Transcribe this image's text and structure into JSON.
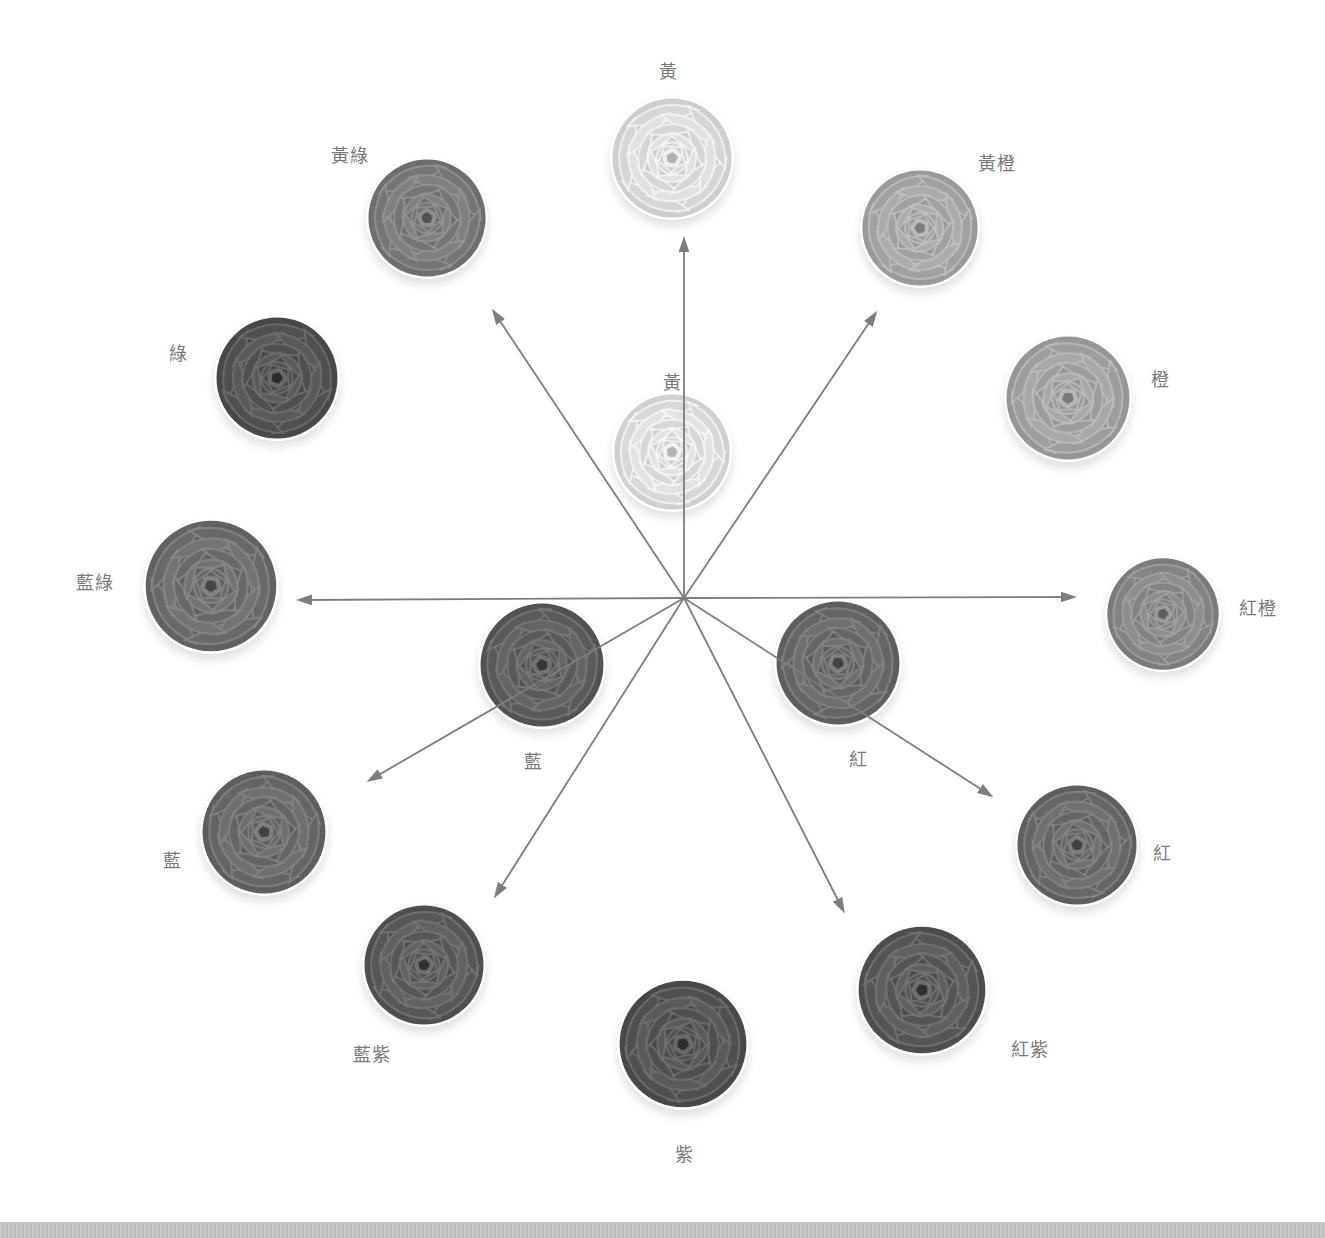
{
  "diagram": {
    "type": "color-wheel-mixing",
    "center": {
      "x": 684,
      "y": 598
    },
    "arrow_color": "#7d7d7d",
    "arrows": [
      {
        "to": "黃 (outer)",
        "x2": 684,
        "y2": 240
      },
      {
        "to": "黃綠",
        "x2": 494,
        "y2": 312
      },
      {
        "to": "黃橙",
        "x2": 875,
        "y2": 314
      },
      {
        "to": "藍綠",
        "x2": 300,
        "y2": 600
      },
      {
        "to": "紅橙",
        "x2": 1073,
        "y2": 597
      },
      {
        "to": "藍 (outer)",
        "x2": 370,
        "y2": 780
      },
      {
        "to": "藍紫",
        "x2": 496,
        "y2": 895
      },
      {
        "to": "紅紫",
        "x2": 843,
        "y2": 910
      },
      {
        "to": "紅 (outer)",
        "x2": 990,
        "y2": 795
      }
    ]
  },
  "inner_roses": [
    {
      "id": "yellow-inner",
      "label": "黃",
      "cx": 672,
      "cy": 452,
      "r": 60,
      "shade": "#dcdcdc",
      "label_x": 672,
      "label_y": 381
    },
    {
      "id": "blue-inner",
      "label": "藍",
      "cx": 542,
      "cy": 665,
      "r": 64,
      "shade": "#5e5e5e",
      "label_x": 533,
      "label_y": 760
    },
    {
      "id": "red-inner",
      "label": "紅",
      "cx": 838,
      "cy": 663,
      "r": 64,
      "shade": "#6a6a6a",
      "label_x": 858,
      "label_y": 758
    }
  ],
  "outer_roses": [
    {
      "id": "yellow",
      "label": "黃",
      "cx": 672,
      "cy": 158,
      "r": 62,
      "shade": "#dadada",
      "label_x": 668,
      "label_y": 70
    },
    {
      "id": "yellow-orange",
      "label": "黃橙",
      "cx": 920,
      "cy": 228,
      "r": 60,
      "shade": "#a6a6a6",
      "label_x": 997,
      "label_y": 162
    },
    {
      "id": "orange",
      "label": "橙",
      "cx": 1068,
      "cy": 398,
      "r": 64,
      "shade": "#a2a2a2",
      "label_x": 1160,
      "label_y": 378
    },
    {
      "id": "red-orange",
      "label": "紅橙",
      "cx": 1163,
      "cy": 614,
      "r": 58,
      "shade": "#878787",
      "label_x": 1258,
      "label_y": 607
    },
    {
      "id": "red",
      "label": "紅",
      "cx": 1077,
      "cy": 845,
      "r": 62,
      "shade": "#6b6b6b",
      "label_x": 1162,
      "label_y": 852
    },
    {
      "id": "red-violet",
      "label": "紅紫",
      "cx": 922,
      "cy": 990,
      "r": 66,
      "shade": "#595959",
      "label_x": 1030,
      "label_y": 1048
    },
    {
      "id": "violet",
      "label": "紫",
      "cx": 683,
      "cy": 1044,
      "r": 66,
      "shade": "#545454",
      "label_x": 684,
      "label_y": 1153
    },
    {
      "id": "blue-violet",
      "label": "藍紫",
      "cx": 424,
      "cy": 965,
      "r": 62,
      "shade": "#5b5b5b",
      "label_x": 372,
      "label_y": 1053
    },
    {
      "id": "blue",
      "label": "藍",
      "cx": 264,
      "cy": 832,
      "r": 64,
      "shade": "#6a6a6a",
      "label_x": 172,
      "label_y": 859
    },
    {
      "id": "blue-green",
      "label": "藍綠",
      "cx": 211,
      "cy": 586,
      "r": 68,
      "shade": "#6e6e6e",
      "label_x": 95,
      "label_y": 581
    },
    {
      "id": "green",
      "label": "綠",
      "cx": 277,
      "cy": 378,
      "r": 63,
      "shade": "#545454",
      "label_x": 178,
      "label_y": 352
    },
    {
      "id": "yellow-green",
      "label": "黃綠",
      "cx": 427,
      "cy": 218,
      "r": 61,
      "shade": "#7a7a7a",
      "label_x": 350,
      "label_y": 154
    }
  ]
}
